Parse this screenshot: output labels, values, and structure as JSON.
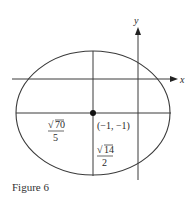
{
  "figure": {
    "caption": "Figure 6",
    "axes": {
      "x_label": "x",
      "y_label": "y"
    },
    "center_label": "(−1, −1)",
    "semi_axis_horizontal": {
      "numerator": "70",
      "denominator": "5",
      "radical": "√"
    },
    "semi_axis_vertical": {
      "numerator": "14",
      "denominator": "2",
      "radical": "√"
    },
    "colors": {
      "stroke": "#3a3a3a",
      "text": "#2a2a2a"
    }
  }
}
